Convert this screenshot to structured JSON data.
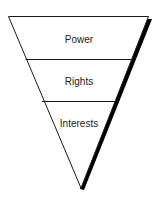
{
  "diagram": {
    "type": "inverted-triangle",
    "layers": [
      {
        "label": "Power"
      },
      {
        "label": "Rights"
      },
      {
        "label": "Interests"
      }
    ],
    "colors": {
      "stroke": "#1a1a1a",
      "shadow": "#000000",
      "fill": "#ffffff",
      "text": "#222222"
    }
  }
}
